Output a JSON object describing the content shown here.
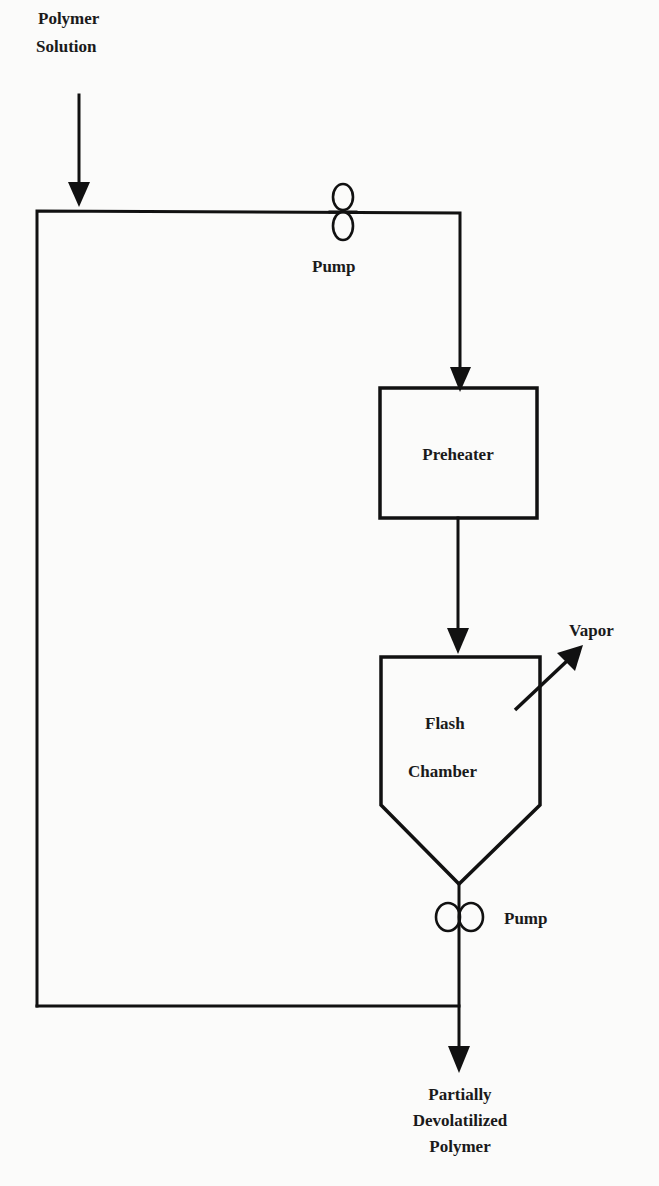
{
  "diagram": {
    "type": "process-flow",
    "colors": {
      "line": "#111111",
      "background": "#fbfbfa",
      "text": "#1a1a1a"
    },
    "labels": {
      "feed_line1": "Polymer",
      "feed_line2": "Solution",
      "pump_top": "Pump",
      "preheater": "Preheater",
      "flash_line1": "Flash",
      "flash_line2": "Chamber",
      "vapor": "Vapor",
      "pump_bottom": "Pump",
      "product_line1": "Partially",
      "product_line2": "Devolatilized",
      "product_line3": "Polymer"
    },
    "nodes": [
      {
        "id": "feed",
        "label": "Polymer Solution",
        "kind": "input"
      },
      {
        "id": "pump1",
        "label": "Pump",
        "kind": "pump"
      },
      {
        "id": "preheater",
        "label": "Preheater",
        "kind": "unit"
      },
      {
        "id": "flash",
        "label": "Flash Chamber",
        "kind": "vessel"
      },
      {
        "id": "vapor",
        "label": "Vapor",
        "kind": "output"
      },
      {
        "id": "pump2",
        "label": "Pump",
        "kind": "pump"
      },
      {
        "id": "product",
        "label": "Partially Devolatilized Polymer",
        "kind": "output"
      }
    ],
    "edges": [
      {
        "from": "feed",
        "to": "pump1"
      },
      {
        "from": "pump1",
        "to": "preheater"
      },
      {
        "from": "preheater",
        "to": "flash"
      },
      {
        "from": "flash",
        "to": "vapor"
      },
      {
        "from": "flash",
        "to": "pump2"
      },
      {
        "from": "pump2",
        "to": "product"
      },
      {
        "from": "pump2",
        "to": "pump1",
        "note": "recycle loop"
      }
    ]
  }
}
